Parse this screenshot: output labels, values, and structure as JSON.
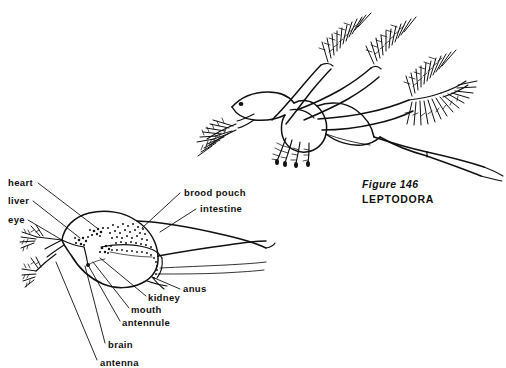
{
  "figure": {
    "caption_number": "Figure  146",
    "caption_name": "LEPTODORA",
    "caption_number_x": 362,
    "caption_number_y": 188,
    "caption_name_x": 362,
    "caption_name_y": 203
  },
  "labels": [
    {
      "id": "heart",
      "text": "heart",
      "x": 8,
      "y": 186,
      "anchor": "start",
      "leader": [
        [
          38,
          183
        ],
        [
          97,
          228
        ]
      ]
    },
    {
      "id": "liver",
      "text": "liver",
      "x": 8,
      "y": 204,
      "anchor": "start",
      "leader": [
        [
          33,
          201
        ],
        [
          80,
          238
        ]
      ]
    },
    {
      "id": "eye",
      "text": "eye",
      "x": 8,
      "y": 223,
      "anchor": "start",
      "leader": [
        [
          28,
          220
        ],
        [
          62,
          240
        ]
      ]
    },
    {
      "id": "brood-pouch",
      "text": "brood pouch",
      "x": 184,
      "y": 196,
      "anchor": "start",
      "leader": [
        [
          180,
          193
        ],
        [
          142,
          228
        ]
      ]
    },
    {
      "id": "intestine",
      "text": "intestine",
      "x": 200,
      "y": 212,
      "anchor": "start",
      "leader": [
        [
          196,
          209
        ],
        [
          160,
          232
        ]
      ]
    },
    {
      "id": "anus",
      "text": "anus",
      "x": 183,
      "y": 292,
      "anchor": "start",
      "leader": [
        [
          180,
          289
        ],
        [
          152,
          277
        ]
      ]
    },
    {
      "id": "kidney",
      "text": "kidney",
      "x": 148,
      "y": 301,
      "anchor": "start",
      "leader": [
        [
          146,
          296
        ],
        [
          100,
          258
        ]
      ]
    },
    {
      "id": "mouth",
      "text": "mouth",
      "x": 131,
      "y": 313,
      "anchor": "start",
      "leader": [
        [
          129,
          308
        ],
        [
          93,
          262
        ]
      ]
    },
    {
      "id": "antennule",
      "text": "antennule",
      "x": 122,
      "y": 326,
      "anchor": "start",
      "leader": [
        [
          120,
          321
        ],
        [
          88,
          265
        ]
      ]
    },
    {
      "id": "brain",
      "text": "brain",
      "x": 108,
      "y": 348,
      "anchor": "start",
      "leader": [
        [
          105,
          343
        ],
        [
          85,
          266
        ]
      ]
    },
    {
      "id": "antenna",
      "text": "antenna",
      "x": 100,
      "y": 366,
      "anchor": "start",
      "leader": [
        [
          97,
          360
        ],
        [
          56,
          262
        ]
      ]
    }
  ],
  "colors": {
    "ink": "#111111",
    "background": "#ffffff"
  },
  "views": {
    "habitus_label": "whole-animal lateral view",
    "anatomy_label": "labeled internal anatomy view"
  }
}
